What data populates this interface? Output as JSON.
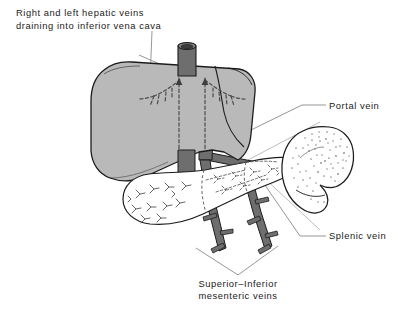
{
  "figure": {
    "type": "medical-line-illustration",
    "background_color": "#ffffff",
    "width": 406,
    "height": 312
  },
  "palette": {
    "organ_fill": "#b9b9b9",
    "organ_outline": "#1c1c1c",
    "vein_fill": "#6e6e6e",
    "vein_outline": "#1c1c1c",
    "pancreas_fill": "#ffffff",
    "spleen_fill": "#ffffff",
    "stipple": "#8d8d8d",
    "leader_line": "#7a7a7a",
    "dashed_vein": "#5d5d5d",
    "text": "#1b1b1b"
  },
  "labels": [
    {
      "id": "hepatic-veins-label",
      "lines": [
        "Right and left hepatic veins",
        "draining into inferior vena cava"
      ],
      "x": 16,
      "y": 16,
      "align": "left"
    },
    {
      "id": "portal-vein-label",
      "lines": [
        "Portal vein"
      ],
      "x": 329,
      "y": 109,
      "align": "left"
    },
    {
      "id": "splenic-vein-label",
      "lines": [
        "Splenic vein"
      ],
      "x": 329,
      "y": 239,
      "align": "left"
    },
    {
      "id": "mesenteric-veins-label",
      "lines": [
        "Superior–Inferior",
        "mesenteric veins"
      ],
      "x": 238,
      "y": 287,
      "align": "center"
    }
  ],
  "structures": [
    {
      "id": "liver",
      "name": "Liver",
      "fill": "#b9b9b9"
    },
    {
      "id": "inferior-vena-cava",
      "name": "Inferior vena cava",
      "fill": "#6e6e6e"
    },
    {
      "id": "hepatic-veins",
      "name": "Right and left hepatic veins",
      "style": "dashed"
    },
    {
      "id": "portal-vein",
      "name": "Portal vein",
      "fill": "#6e6e6e"
    },
    {
      "id": "splenic-vein",
      "name": "Splenic vein",
      "fill": "#6e6e6e"
    },
    {
      "id": "superior-mesenteric-vein",
      "name": "Superior mesenteric vein",
      "fill": "#6e6e6e"
    },
    {
      "id": "inferior-mesenteric-vein",
      "name": "Inferior mesenteric vein",
      "fill": "#6e6e6e"
    },
    {
      "id": "pancreas",
      "name": "Pancreas",
      "fill": "#ffffff"
    },
    {
      "id": "spleen",
      "name": "Spleen",
      "fill": "#ffffff"
    }
  ]
}
